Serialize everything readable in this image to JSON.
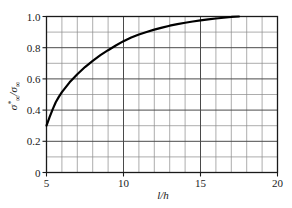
{
  "figure": {
    "background_color": "#ffffff",
    "curve_color": "#000000",
    "grid_minor_color": "#8a8a8a",
    "grid_major_color": "#4a4a4a",
    "frame_color": "#1a1a1a"
  },
  "chart_data": {
    "type": "line",
    "title": "",
    "subtitle": "",
    "xlabel": "l/h",
    "xlabel_parts": {
      "numerator": "l",
      "slash": "/",
      "denominator": "h"
    },
    "ylabel": "σ*∞/σ∞",
    "ylabel_parts": {
      "symbol1": "σ",
      "sup1": "*",
      "sub1": "∞",
      "slash": "/",
      "symbol2": "σ",
      "sub2": "∞"
    },
    "xlim": [
      5,
      20
    ],
    "ylim": [
      0,
      1.0
    ],
    "grid": true,
    "grid_x_step": 1,
    "grid_y_step": 0.1,
    "legend": null,
    "legend_position": "none",
    "x_ticks_major": [
      5,
      10,
      15,
      20
    ],
    "x_tick_labels": [
      "5",
      "10",
      "15",
      "20"
    ],
    "x_ticks_minor": [
      6,
      7,
      8,
      9,
      11,
      12,
      13,
      14,
      16,
      17,
      18,
      19
    ],
    "y_ticks_major": [
      0,
      0.2,
      0.4,
      0.6,
      0.8,
      1.0
    ],
    "y_tick_labels": [
      "0",
      "0.2",
      "0.4",
      "0.6",
      "0.8",
      "1.0"
    ],
    "y_ticks_minor": [
      0.1,
      0.3,
      0.5,
      0.7,
      0.9
    ],
    "series": [
      {
        "name": "stress ratio curve",
        "color": "#000000",
        "x": [
          5.0,
          5.2,
          5.4,
          5.6,
          5.8,
          6.0,
          6.5,
          7.0,
          7.5,
          8.0,
          8.5,
          9.0,
          9.5,
          10.0,
          10.5,
          11.0,
          11.5,
          12.0,
          12.5,
          13.0,
          13.5,
          14.0,
          14.5,
          15.0,
          15.5,
          16.0,
          16.5,
          17.0,
          17.5
        ],
        "y": [
          0.3,
          0.355,
          0.405,
          0.45,
          0.485,
          0.515,
          0.578,
          0.63,
          0.676,
          0.716,
          0.752,
          0.784,
          0.814,
          0.842,
          0.865,
          0.885,
          0.901,
          0.916,
          0.929,
          0.941,
          0.951,
          0.96,
          0.968,
          0.975,
          0.981,
          0.987,
          0.992,
          0.997,
          1.0
        ]
      }
    ],
    "annotations": []
  }
}
